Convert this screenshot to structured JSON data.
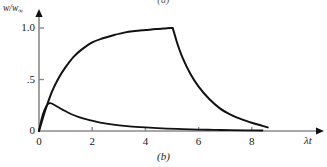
{
  "figure": {
    "caption_top": "(a)",
    "caption_bottom": "(b)"
  },
  "chart_data": {
    "type": "line",
    "title": "",
    "subtitle": "",
    "xlabel": "λt",
    "ylabel": "w/w∞",
    "ylabel_main": "w/w",
    "ylabel_sub": "∞",
    "xlim": [
      0,
      10.7
    ],
    "ylim": [
      0,
      1.12
    ],
    "grid": false,
    "legend": "none",
    "axis_color": "#8a8a8a",
    "curve_color": "#111111",
    "xticks": [
      0,
      2,
      4,
      6,
      8
    ],
    "xticklabels": [
      "0",
      "2",
      "4",
      "6",
      "8"
    ],
    "yticks": [
      0,
      0.5,
      1.0
    ],
    "yticklabels": [
      "0",
      ".5",
      "1.0"
    ],
    "annotations": [
      "Source on from λt = 0 to λt = 5, then removed",
      "Upper curve saturates at w/w∞ = 1.0",
      "Lower curve peaks near λt = 0.4 at w/w∞ ≈ 0.27"
    ],
    "series": [
      {
        "name": "saturating-then-decaying",
        "x": [
          0,
          0.15,
          0.3,
          0.5,
          0.75,
          1.0,
          1.3,
          1.6,
          2.0,
          2.4,
          2.8,
          3.2,
          3.6,
          4.0,
          4.4,
          4.7,
          5.0,
          5.05,
          5.2,
          5.4,
          5.7,
          6.0,
          6.4,
          6.8,
          7.2,
          7.6,
          8.0,
          8.4,
          8.6
        ],
        "y": [
          0,
          0.13,
          0.25,
          0.39,
          0.52,
          0.62,
          0.72,
          0.79,
          0.86,
          0.9,
          0.93,
          0.955,
          0.97,
          0.98,
          0.99,
          0.995,
          1.0,
          0.98,
          0.85,
          0.71,
          0.55,
          0.43,
          0.31,
          0.22,
          0.16,
          0.115,
          0.08,
          0.05,
          0.035
        ]
      },
      {
        "name": "peaked-decaying",
        "x": [
          0,
          0.1,
          0.2,
          0.3,
          0.4,
          0.5,
          0.7,
          0.9,
          1.2,
          1.5,
          1.9,
          2.3,
          2.8,
          3.3,
          3.8,
          4.3,
          4.8,
          5.4,
          6.0,
          6.6,
          7.2,
          7.8,
          8.4
        ],
        "y": [
          0,
          0.12,
          0.2,
          0.25,
          0.27,
          0.265,
          0.235,
          0.205,
          0.165,
          0.135,
          0.105,
          0.082,
          0.062,
          0.048,
          0.038,
          0.03,
          0.024,
          0.018,
          0.014,
          0.011,
          0.008,
          0.006,
          0.005
        ]
      }
    ]
  }
}
